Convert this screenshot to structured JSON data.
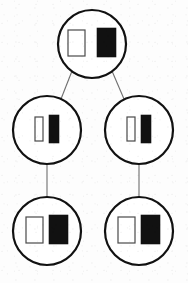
{
  "diagram": {
    "type": "tree",
    "title": "",
    "canvas": {
      "width": 188,
      "height": 283
    },
    "background_color": "#fdfdfd",
    "stroke_color": "#111111",
    "edge_color": "#6e6e6e",
    "open_chip_color": "#ffffff",
    "filled_chip_color": "#111111",
    "node_count": 5,
    "edge_count": 4,
    "levels": 3,
    "nodes": [
      {
        "id": "node-top",
        "label": "",
        "level": 1,
        "cx": 92,
        "cy": 44,
        "r": 34,
        "stroke_width": 2.2,
        "chips": [
          {
            "id": "chip-top-left",
            "fill": "open",
            "x": 68,
            "y": 30,
            "width": 17,
            "height": 26
          },
          {
            "id": "chip-top-right",
            "fill": "filled",
            "x": 97,
            "y": 28,
            "width": 19,
            "height": 29
          }
        ]
      },
      {
        "id": "node-mid-left",
        "label": "",
        "level": 2,
        "cx": 47,
        "cy": 130,
        "r": 34,
        "stroke_width": 2.2,
        "chips": [
          {
            "id": "chip-mid-left-left",
            "fill": "open",
            "x": 35,
            "y": 117,
            "width": 8,
            "height": 24
          },
          {
            "id": "chip-mid-left-right",
            "fill": "filled",
            "x": 49,
            "y": 115,
            "width": 10,
            "height": 28
          }
        ]
      },
      {
        "id": "node-mid-right",
        "label": "",
        "level": 2,
        "cx": 139,
        "cy": 130,
        "r": 34,
        "stroke_width": 2.2,
        "chips": [
          {
            "id": "chip-mid-right-left",
            "fill": "open",
            "x": 127,
            "y": 117,
            "width": 8,
            "height": 24
          },
          {
            "id": "chip-mid-right-right",
            "fill": "filled",
            "x": 141,
            "y": 115,
            "width": 10,
            "height": 28
          }
        ]
      },
      {
        "id": "node-bottom-left",
        "label": "",
        "level": 3,
        "cx": 47,
        "cy": 231,
        "r": 34,
        "stroke_width": 2.2,
        "chips": [
          {
            "id": "chip-bottom-left-left",
            "fill": "open",
            "x": 26,
            "y": 217,
            "width": 17,
            "height": 26
          },
          {
            "id": "chip-bottom-left-right",
            "fill": "filled",
            "x": 49,
            "y": 215,
            "width": 19,
            "height": 29
          }
        ]
      },
      {
        "id": "node-bottom-right",
        "label": "",
        "level": 3,
        "cx": 139,
        "cy": 231,
        "r": 34,
        "stroke_width": 2.2,
        "chips": [
          {
            "id": "chip-bottom-right-left",
            "fill": "open",
            "x": 118,
            "y": 217,
            "width": 17,
            "height": 26
          },
          {
            "id": "chip-bottom-right-right",
            "fill": "filled",
            "x": 141,
            "y": 215,
            "width": 19,
            "height": 29
          }
        ]
      }
    ],
    "edges": [
      {
        "id": "edge-top-to-mid-left",
        "from": "node-top",
        "to": "node-mid-left",
        "x1": 72,
        "y1": 71,
        "x2": 61,
        "y2": 99
      },
      {
        "id": "edge-top-to-mid-right",
        "from": "node-top",
        "to": "node-mid-right",
        "x1": 112,
        "y1": 71,
        "x2": 124,
        "y2": 99
      },
      {
        "id": "edge-mid-left-to-bottom-left",
        "from": "node-mid-left",
        "to": "node-bottom-left",
        "x1": 47,
        "y1": 165,
        "x2": 47,
        "y2": 197
      },
      {
        "id": "edge-mid-right-to-bottom-right",
        "from": "node-mid-right",
        "to": "node-bottom-right",
        "x1": 139,
        "y1": 165,
        "x2": 139,
        "y2": 197
      }
    ]
  }
}
